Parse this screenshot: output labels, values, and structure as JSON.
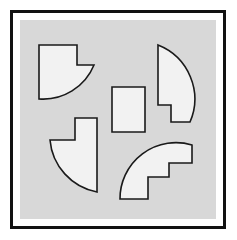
{
  "figure": {
    "canvas": {
      "width": 237,
      "height": 240
    },
    "colors": {
      "page_background": "#ffffff",
      "frame_border": "#111111",
      "frame_inner_padding": "#ffffff",
      "panel_background": "#d8d8d8",
      "shape_fill": "#f2f2f2",
      "shape_stroke": "#1a1a1a"
    },
    "frame": {
      "x": 10,
      "y": 10,
      "width": 216,
      "height": 219,
      "border_width": 3
    },
    "panel": {
      "x": 20,
      "y": 20,
      "width": 196,
      "height": 199
    },
    "shape_count": 5
  },
  "shapes": [
    {
      "id": "shape-top-left",
      "name": "notched-quarter-disc-top-left",
      "label": "Top-left notched quarter disc",
      "fill": "#f2f2f2",
      "stroke": "#1a1a1a",
      "stroke_width": 1.6,
      "path": "M 39 45 L 77 45 L 77 65 L 94 65 A 55 55 0 0 1 39 99 Z"
    },
    {
      "id": "shape-top-right",
      "name": "notched-arc-segment-top-right",
      "label": "Top-right arc segment with corner notch",
      "fill": "#f2f2f2",
      "stroke": "#1a1a1a",
      "stroke_width": 1.6,
      "path": "M 158 45 A 58 58 0 0 1 190 122 L 171 122 L 171 105 L 158 105 Z"
    },
    {
      "id": "shape-center",
      "name": "center-rectangle",
      "label": "Center upright rectangle",
      "fill": "#f2f2f2",
      "stroke": "#1a1a1a",
      "stroke_width": 1.6,
      "path": "M 112 87 L 145 87 L 145 132 L 112 132 Z"
    },
    {
      "id": "shape-bottom-left",
      "name": "notched-quarter-disc-bottom-left",
      "label": "Bottom-left notched quarter disc",
      "fill": "#f2f2f2",
      "stroke": "#1a1a1a",
      "stroke_width": 1.6,
      "path": "M 75 118 L 97 118 L 97 192 A 58 58 0 0 1 50 140 L 75 140 Z"
    },
    {
      "id": "shape-bottom-right",
      "name": "staircase-quarter-annulus-bottom-right",
      "label": "Bottom-right staircase quarter annulus",
      "fill": "#f2f2f2",
      "stroke": "#1a1a1a",
      "stroke_width": 1.6,
      "path": "M 120 199 A 56 56 0 0 1 192 145 L 192 163 L 169 163 L 169 177 L 148 177 L 148 199 Z"
    }
  ]
}
